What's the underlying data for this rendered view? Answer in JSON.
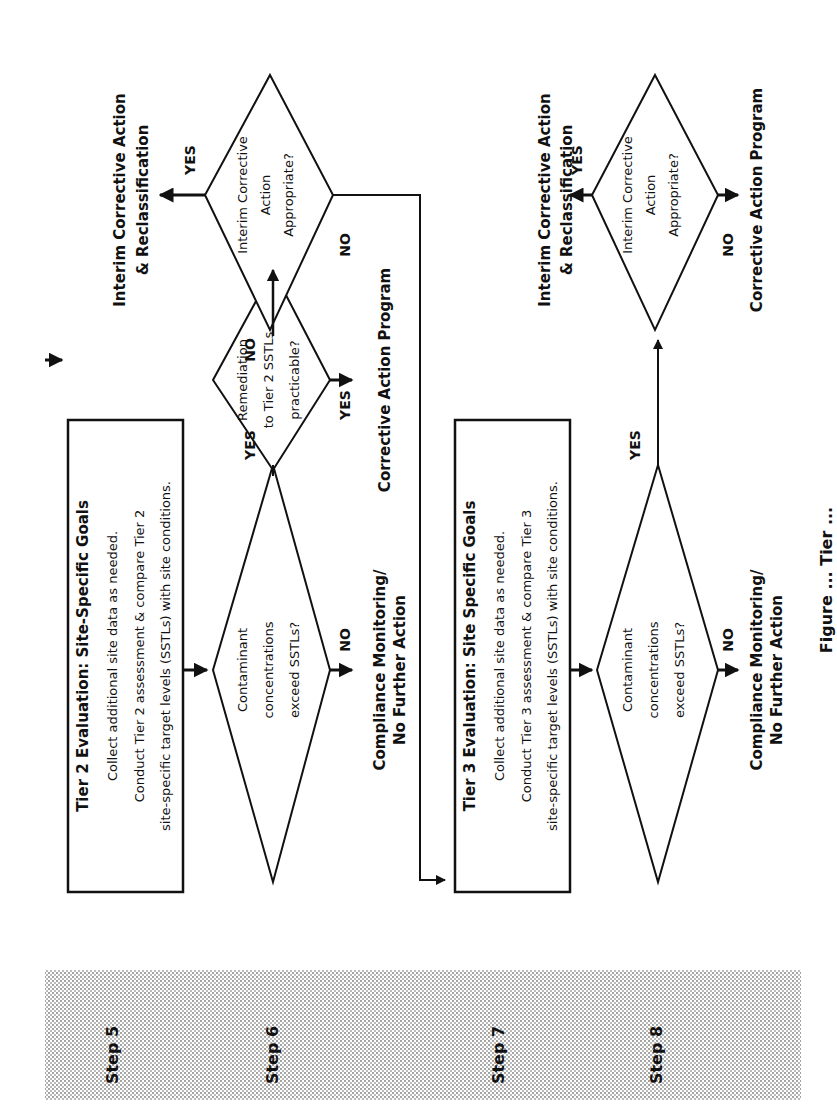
{
  "steps": [
    {
      "label": "Step 5"
    },
    {
      "label": "Step 6"
    },
    {
      "label": "Step 7"
    },
    {
      "label": "Step 8"
    }
  ],
  "tier2": {
    "title": "Tier 2 Evaluation: Site-Specific Goals",
    "line1": "Collect additional site data as needed.",
    "line2": "Conduct Tier 2 assessment & compare Tier 2",
    "line3": "site-specific target levels (SSTLs) with site conditions."
  },
  "tier3": {
    "title": "Tier 3 Evaluation: Site Specific Goals",
    "line1": "Collect additional site data as needed.",
    "line2": "Conduct Tier 3 assessment & compare Tier 3",
    "line3": "site-specific target levels (SSTLs) with site conditions."
  },
  "decisions": {
    "exceed6": [
      "Contaminant",
      "concentrations",
      "exceed SSTLs?"
    ],
    "remediation": [
      "Remediation",
      "to Tier 2 SSTLs",
      "practicable?"
    ],
    "interim6": [
      "Interim Corrective",
      "Action",
      "Appropriate?"
    ],
    "exceed8": [
      "Contaminant",
      "concentrations",
      "exceed SSTLs?"
    ],
    "interim8": [
      "Interim Corrective",
      "Action",
      "Appropriate?"
    ]
  },
  "labels": {
    "yes": "YES",
    "no": "NO"
  },
  "outcomes": {
    "compliance6": [
      "Compliance Monitoring/",
      "No Further Action"
    ],
    "cap6": "Corrective Action Program",
    "interim6": [
      "Interim Corrective Action",
      "& Reclassification"
    ],
    "compliance8": [
      "Compliance Monitoring/",
      "No Further Action"
    ],
    "interim8": [
      "Interim Corrective Action",
      "& Reclassification"
    ],
    "cap8": "Corrective Action Program"
  },
  "caption": "Figure ... Tier ..."
}
